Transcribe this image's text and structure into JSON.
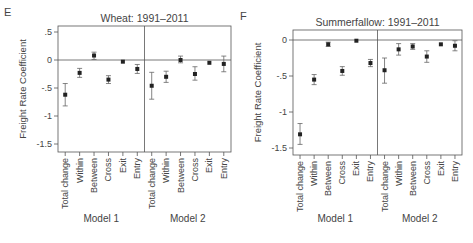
{
  "chart_data": [
    {
      "panel_label": "E",
      "type": "scatter",
      "title": "Wheat: 1991–2011",
      "ylabel": "Freight Rate Coefficient",
      "xlabel": "",
      "ylim": [
        -1.6,
        0.6
      ],
      "yticks": [
        0.5,
        0,
        -0.5,
        -1,
        -1.5
      ],
      "ytick_labels": [
        ".5",
        "0",
        "-.5",
        "-1",
        "-1.5"
      ],
      "grid": false,
      "reference_line": 0,
      "groups": [
        "Model 1",
        "Model 2"
      ],
      "categories": [
        "Total change",
        "Within",
        "Between",
        "Cross",
        "Exit",
        "Entry"
      ],
      "series": [
        {
          "name": "Model 1",
          "values": [
            -0.62,
            -0.23,
            0.08,
            -0.35,
            -0.03,
            -0.16
          ],
          "ci_low": [
            -0.82,
            -0.31,
            0.01,
            -0.42,
            -0.04,
            -0.24
          ],
          "ci_high": [
            -0.42,
            -0.15,
            0.14,
            -0.28,
            -0.02,
            -0.08
          ]
        },
        {
          "name": "Model 2",
          "values": [
            -0.46,
            -0.3,
            0.0,
            -0.25,
            -0.05,
            -0.07
          ],
          "ci_low": [
            -0.7,
            -0.4,
            -0.05,
            -0.36,
            -0.06,
            -0.21
          ],
          "ci_high": [
            -0.22,
            -0.2,
            0.07,
            -0.12,
            -0.04,
            0.07
          ]
        }
      ]
    },
    {
      "panel_label": "F",
      "type": "scatter",
      "title": "Summerfallow: 1991–2011",
      "ylabel": "Freight Rate Coefficient",
      "xlabel": "",
      "ylim": [
        -1.6,
        0.1
      ],
      "yticks": [
        0,
        -0.5,
        -1,
        -1.5
      ],
      "ytick_labels": [
        "0",
        "-.5",
        "-1",
        "-1.5"
      ],
      "grid": false,
      "reference_line": 0,
      "groups": [
        "Model 1",
        "Model 2"
      ],
      "categories": [
        "Total change",
        "Within",
        "Between",
        "Cross",
        "Exit",
        "Entry"
      ],
      "series": [
        {
          "name": "Model 1",
          "values": [
            -1.31,
            -0.55,
            -0.06,
            -0.43,
            -0.01,
            -0.32
          ],
          "ci_low": [
            -1.45,
            -0.62,
            -0.09,
            -0.49,
            -0.02,
            -0.37
          ],
          "ci_high": [
            -1.16,
            -0.48,
            -0.03,
            -0.37,
            0.0,
            -0.27
          ]
        },
        {
          "name": "Model 2",
          "values": [
            -0.42,
            -0.13,
            -0.09,
            -0.23,
            -0.06,
            -0.08
          ],
          "ci_low": [
            -0.6,
            -0.21,
            -0.13,
            -0.31,
            -0.07,
            -0.15
          ],
          "ci_high": [
            -0.25,
            -0.05,
            -0.05,
            -0.15,
            -0.05,
            -0.01
          ]
        }
      ]
    }
  ],
  "layout": [
    {
      "left": 58,
      "right": 231,
      "top": 26,
      "bottom": 152,
      "y0": 60,
      "pxPerUnit": 56,
      "svgX": 0
    },
    {
      "left": 293,
      "right": 462,
      "top": 30,
      "bottom": 155,
      "y0": 40,
      "pxPerUnit": 72,
      "svgX": 0
    }
  ],
  "colors": {
    "axis": "#555555",
    "point": "#222222",
    "text": "#444444"
  }
}
